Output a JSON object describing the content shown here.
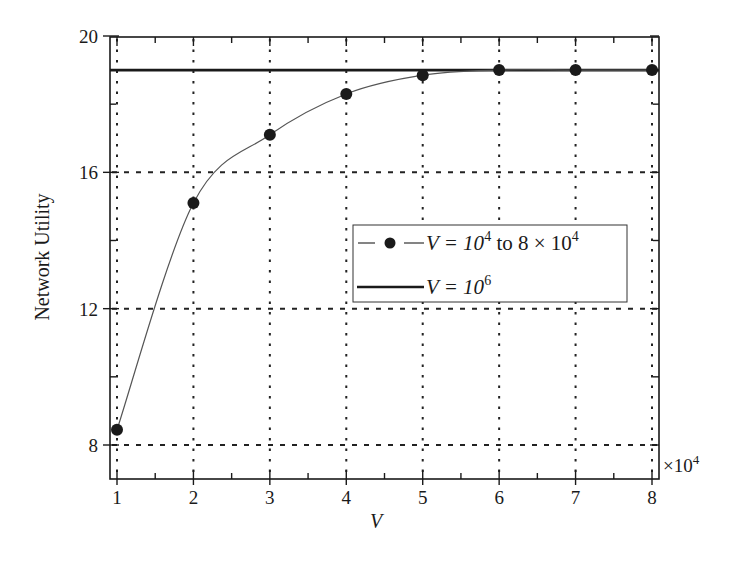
{
  "chart_data": {
    "type": "line",
    "title": "",
    "xlabel": "V",
    "ylabel": "Network Utility",
    "x_multiplier_label": "×10^4",
    "x": [
      1,
      2,
      3,
      4,
      5,
      6,
      7,
      8
    ],
    "xlim": [
      0.9,
      8.1
    ],
    "ylim": [
      7.0,
      20.0
    ],
    "xticks": [
      "1",
      "2",
      "3",
      "4",
      "5",
      "6",
      "7",
      "8"
    ],
    "yticks": [
      "8",
      "12",
      "16",
      "20"
    ],
    "grid": true,
    "grid_style": "dotted",
    "legend_position": "center-right",
    "series": [
      {
        "name": "V = 10^4 to 8 × 10^4",
        "legend_label_main": "V = 10",
        "legend_label_exp1": "4",
        "legend_label_mid": " to 8 × 10",
        "legend_label_exp2": "4",
        "style": "thin line with filled circle markers",
        "color": "#1a1a1a",
        "values": [
          8.45,
          15.1,
          17.1,
          18.3,
          18.85,
          19.0,
          19.0,
          19.0
        ]
      },
      {
        "name": "V = 10^6",
        "legend_label_main": "V = 10",
        "legend_label_exp1": "6",
        "style": "thick solid horizontal line",
        "color": "#1a1a1a",
        "values": [
          19.0,
          19.0,
          19.0,
          19.0,
          19.0,
          19.0,
          19.0,
          19.0
        ]
      }
    ]
  },
  "axes": {
    "xlabel": "V",
    "ylabel": "Network Utility",
    "x_multiplier_base": "×10",
    "x_multiplier_exp": "4",
    "xticks": [
      "1",
      "2",
      "3",
      "4",
      "5",
      "6",
      "7",
      "8"
    ],
    "yticks": [
      "8",
      "12",
      "16",
      "20"
    ]
  },
  "legend": {
    "item1_main": "V = 10",
    "item1_exp1": "4",
    "item1_mid": " to 8 × 10",
    "item1_exp2": "4",
    "item2_main": "V = 10",
    "item2_exp": "6"
  }
}
